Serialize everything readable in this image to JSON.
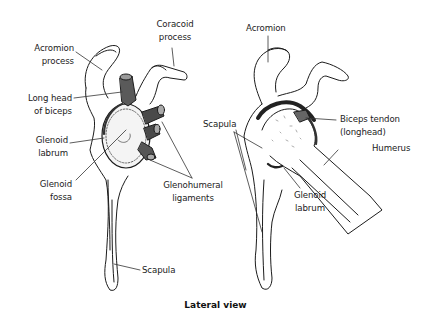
{
  "figure": {
    "caption": "Lateral view",
    "left_view": {
      "labels": {
        "acromion_process": [
          "Acromion",
          "process"
        ],
        "coracoid_process": [
          "Coracoid",
          "process"
        ],
        "long_head_of_biceps": [
          "Long head",
          "of biceps"
        ],
        "glenoid_labrum": [
          "Glenoid",
          "labrum"
        ],
        "glenoid_fossa": [
          "Glenoid",
          "fossa"
        ],
        "glenohumeral_ligaments": [
          "Glenohumeral",
          "ligaments"
        ],
        "scapula": "Scapula"
      }
    },
    "right_view": {
      "labels": {
        "acromion": "Acromion",
        "scapula": "Scapula",
        "biceps_tendon": [
          "Biceps tendon",
          "(longhead)"
        ],
        "humerus": "Humerus",
        "glenoid_labrum": [
          "Glenoid",
          "labrum"
        ]
      }
    }
  }
}
